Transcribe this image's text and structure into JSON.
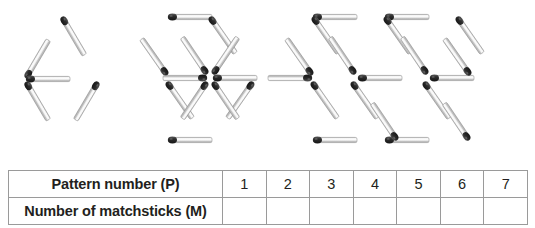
{
  "figure": {
    "name": "matchstick-pattern-sequence",
    "stick_color": "#d8d8d8",
    "stick_edge_color": "#8e8e8e",
    "head_color": "#2b2b2b",
    "patterns": [
      {
        "index": 1,
        "label": "Pattern 1",
        "shape": "rhombus-two-triangles",
        "matchstick_count": 5
      },
      {
        "index": 2,
        "label": "Pattern 2",
        "shape": "hexagon-six-triangles",
        "matchstick_count": 12
      },
      {
        "index": 3,
        "label": "Pattern 3",
        "shape": "double-hexagon-ten-triangles",
        "matchstick_count": 19
      }
    ]
  },
  "table": {
    "name": "pattern-number-matchsticks-table",
    "rows": [
      {
        "label": "Pattern number (P)",
        "cells": [
          "1",
          "2",
          "3",
          "4",
          "5",
          "6",
          "7"
        ]
      },
      {
        "label": "Number of matchsticks (M)",
        "cells": [
          "",
          "",
          "",
          "",
          "",
          "",
          ""
        ]
      }
    ],
    "border_color": "#9a9a9a",
    "text_color": "#231f20"
  }
}
